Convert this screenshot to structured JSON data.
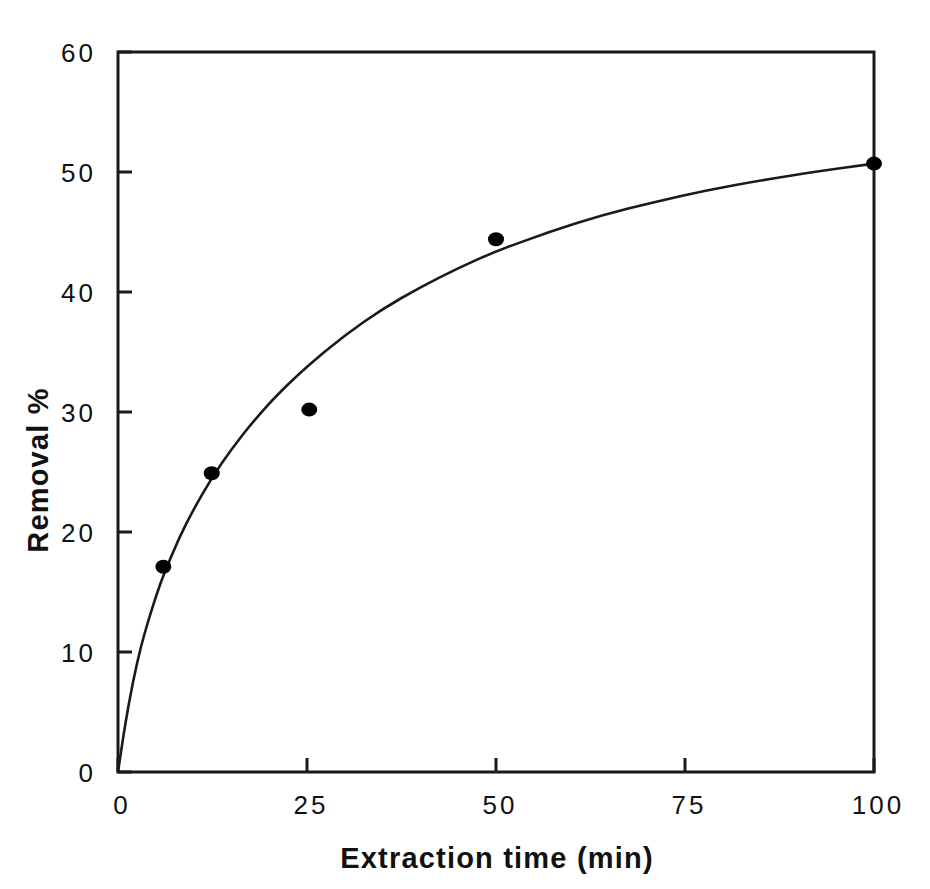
{
  "chart_data": {
    "type": "scatter",
    "title": "",
    "subtitle": "",
    "xlabel": "Extraction time (min)",
    "ylabel": "Removal %",
    "xlim": [
      0,
      100
    ],
    "ylim": [
      0,
      60
    ],
    "xticks": [
      0,
      25,
      50,
      75,
      100
    ],
    "xtick_labels": [
      "0",
      "25",
      "50",
      "75",
      "100"
    ],
    "yticks": [
      0,
      10,
      20,
      30,
      40,
      50,
      60
    ],
    "ytick_labels": [
      "0",
      "10",
      "20",
      "30",
      "40",
      "50",
      "60"
    ],
    "grid": false,
    "legend": false,
    "legend_position": "none",
    "series": [
      {
        "name": "Removal %",
        "marker": "filled-circle",
        "marker_color": "#000000",
        "line_color": "#1a1a1a",
        "points": [
          {
            "x": 6.0,
            "y": 17.1
          },
          {
            "x": 12.4,
            "y": 24.9
          },
          {
            "x": 25.3,
            "y": 30.2
          },
          {
            "x": 50.0,
            "y": 44.4
          },
          {
            "x": 100.0,
            "y": 50.7
          }
        ],
        "fit_curve": [
          {
            "x": 0.0,
            "y": 0.0
          },
          {
            "x": 1.0,
            "y": 4.2
          },
          {
            "x": 2.0,
            "y": 7.6
          },
          {
            "x": 3.0,
            "y": 10.4
          },
          {
            "x": 4.0,
            "y": 12.6
          },
          {
            "x": 5.0,
            "y": 14.6
          },
          {
            "x": 6.0,
            "y": 16.4
          },
          {
            "x": 8.0,
            "y": 19.4
          },
          {
            "x": 10.0,
            "y": 21.9
          },
          {
            "x": 12.4,
            "y": 24.5
          },
          {
            "x": 15.0,
            "y": 26.9
          },
          {
            "x": 18.0,
            "y": 29.3
          },
          {
            "x": 21.0,
            "y": 31.4
          },
          {
            "x": 25.0,
            "y": 33.8
          },
          {
            "x": 30.0,
            "y": 36.4
          },
          {
            "x": 35.0,
            "y": 38.6
          },
          {
            "x": 40.0,
            "y": 40.4
          },
          {
            "x": 45.0,
            "y": 42.0
          },
          {
            "x": 50.0,
            "y": 43.4
          },
          {
            "x": 57.0,
            "y": 45.0
          },
          {
            "x": 64.0,
            "y": 46.4
          },
          {
            "x": 71.0,
            "y": 47.5
          },
          {
            "x": 78.0,
            "y": 48.5
          },
          {
            "x": 85.0,
            "y": 49.3
          },
          {
            "x": 92.0,
            "y": 50.0
          },
          {
            "x": 100.0,
            "y": 50.7
          }
        ]
      }
    ]
  },
  "axes": {
    "frame_color": "#1a1a1a",
    "background": "#ffffff"
  }
}
